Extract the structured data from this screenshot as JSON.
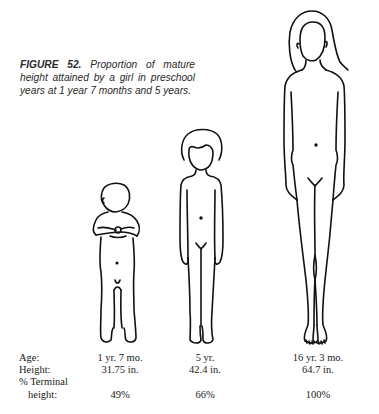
{
  "caption": {
    "figure_label": "FIGURE 52.",
    "text": "Proportion of mature height attained by a girl in preschool years at 1 year 7 months and 5 years."
  },
  "figures": [
    {
      "name": "toddler",
      "description": "girl at 1 yr 7 mo, hands clasped at chest"
    },
    {
      "name": "child",
      "description": "girl at 5 yr, arms at sides"
    },
    {
      "name": "adult",
      "description": "woman at 16 yr 3 mo, long hair, arms at sides"
    }
  ],
  "table": {
    "row_labels": {
      "age": "Age:",
      "height": "Height:",
      "terminal_1": "% Terminal",
      "terminal_2": "height:"
    },
    "columns": [
      {
        "age": "1 yr. 7 mo.",
        "height": "31.75 in.",
        "terminal": "49%"
      },
      {
        "age": "5 yr.",
        "height": "42.4 in.",
        "terminal": "66%"
      },
      {
        "age": "16 yr. 3 mo.",
        "height": "64.7 in.",
        "terminal": "100%"
      }
    ]
  }
}
